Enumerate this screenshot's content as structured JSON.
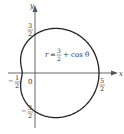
{
  "chart_data": {
    "type": "line",
    "subtype": "polar",
    "title": "",
    "equation": "r = 3/2 + cos θ",
    "equation_label": {
      "lhs": "r",
      "num": "3",
      "den": "2",
      "rhs": "+ cos θ"
    },
    "xlabel": "x",
    "ylabel": "y",
    "origin_label": "0",
    "intercepts": [
      {
        "axis": "x",
        "value": 2.5,
        "label_num": "5",
        "label_den": "2",
        "sign": ""
      },
      {
        "axis": "x",
        "value": -0.5,
        "label_num": "1",
        "label_den": "2",
        "sign": "−"
      },
      {
        "axis": "y",
        "value": 1.5,
        "label_num": "3",
        "label_den": "2",
        "sign": ""
      },
      {
        "axis": "y",
        "value": -1.5,
        "label_num": "3",
        "label_den": "2",
        "sign": "−"
      }
    ],
    "xlim": [
      -1.05,
      3.2
    ],
    "ylim": [
      -2.15,
      2.65
    ],
    "grid": false,
    "legend": null,
    "curve_color": "#222222",
    "axis_color": "#555555"
  }
}
